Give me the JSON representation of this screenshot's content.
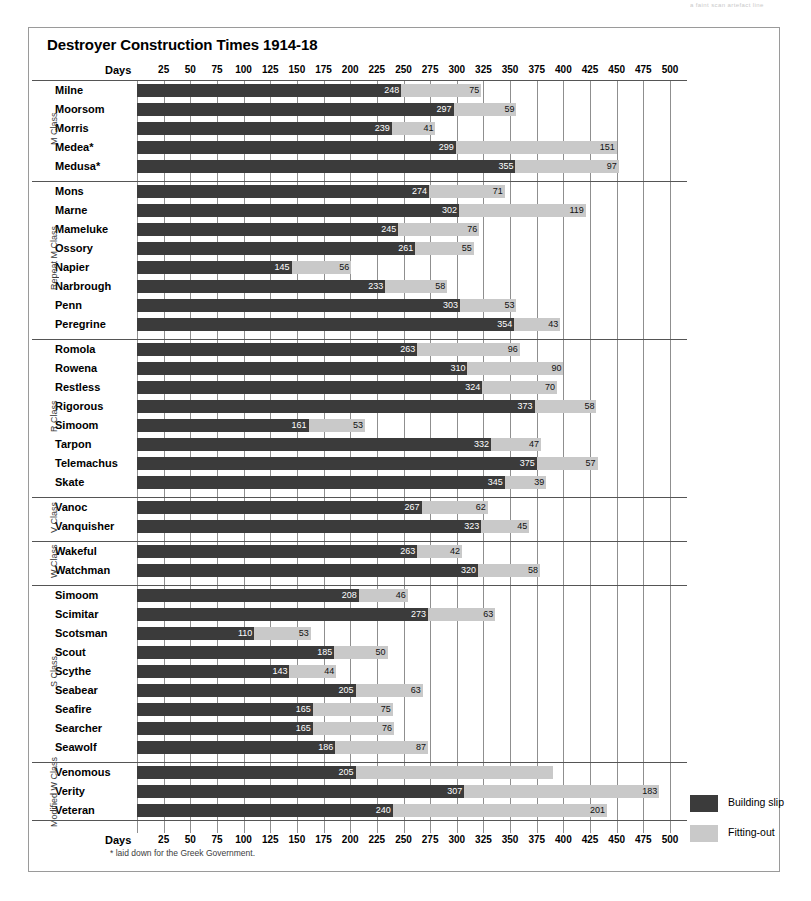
{
  "scan_header": "a faint scan artefact line",
  "title": "Destroyer Construction Times 1914-18",
  "axis": {
    "days_label": "Days",
    "ticks": [
      25,
      50,
      75,
      100,
      125,
      150,
      175,
      200,
      225,
      250,
      275,
      300,
      325,
      350,
      375,
      400,
      425,
      450,
      475,
      500
    ]
  },
  "footnote": "* laid down for the Greek Government.",
  "legend": {
    "position": "right",
    "items": [
      {
        "label": "Building slip",
        "color": "#3b3b3b",
        "key": "slip"
      },
      {
        "label": "Fitting-out",
        "color": "#c9c9c9",
        "key": "fit"
      }
    ]
  },
  "colors": {
    "building_slip": "#3b3b3b",
    "fitting_out": "#c9c9c9",
    "grid": "#8f8f8f",
    "frame": "#9a9a9a"
  },
  "chart_data": {
    "type": "bar",
    "orientation": "horizontal",
    "stacked": true,
    "title": "Destroyer Construction Times 1914-18",
    "xlabel": "Days",
    "ylabel": "",
    "xlim": [
      0,
      500
    ],
    "grid": true,
    "legend": [
      "Building slip",
      "Fitting-out"
    ],
    "series": [
      {
        "name": "Building slip",
        "color": "#3b3b3b"
      },
      {
        "name": "Fitting-out",
        "color": "#c9c9c9"
      }
    ],
    "groups": [
      {
        "class": "M Class",
        "rows": [
          {
            "name": "Milne",
            "slip": 248,
            "fit": 75
          },
          {
            "name": "Moorsom",
            "slip": 297,
            "fit": 59
          },
          {
            "name": "Morris",
            "slip": 239,
            "fit": 41
          },
          {
            "name": "Medea*",
            "slip": 299,
            "fit": 151
          },
          {
            "name": "Medusa*",
            "slip": 355,
            "fit": 97
          }
        ]
      },
      {
        "class": "Repeat M Class",
        "rows": [
          {
            "name": "Mons",
            "slip": 274,
            "fit": 71
          },
          {
            "name": "Marne",
            "slip": 302,
            "fit": 119
          },
          {
            "name": "Mameluke",
            "slip": 245,
            "fit": 76
          },
          {
            "name": "Ossory",
            "slip": 261,
            "fit": 55
          },
          {
            "name": "Napier",
            "slip": 145,
            "fit": 56
          },
          {
            "name": "Narbrough",
            "slip": 233,
            "fit": 58
          },
          {
            "name": "Penn",
            "slip": 303,
            "fit": 53
          },
          {
            "name": "Peregrine",
            "slip": 354,
            "fit": 43
          }
        ]
      },
      {
        "class": "R Class",
        "rows": [
          {
            "name": "Romola",
            "slip": 263,
            "fit": 96
          },
          {
            "name": "Rowena",
            "slip": 310,
            "fit": 90
          },
          {
            "name": "Restless",
            "slip": 324,
            "fit": 70
          },
          {
            "name": "Rigorous",
            "slip": 373,
            "fit": 58
          },
          {
            "name": "Simoom",
            "slip": 161,
            "fit": 53
          },
          {
            "name": "Tarpon",
            "slip": 332,
            "fit": 47
          },
          {
            "name": "Telemachus",
            "slip": 375,
            "fit": 57
          },
          {
            "name": "Skate",
            "slip": 345,
            "fit": 39
          }
        ]
      },
      {
        "class": "V Class",
        "rows": [
          {
            "name": "Vanoc",
            "slip": 267,
            "fit": 62
          },
          {
            "name": "Vanquisher",
            "slip": 323,
            "fit": 45
          }
        ]
      },
      {
        "class": "W Class",
        "rows": [
          {
            "name": "Wakeful",
            "slip": 263,
            "fit": 42
          },
          {
            "name": "Watchman",
            "slip": 320,
            "fit": 58
          }
        ]
      },
      {
        "class": "S Class",
        "rows": [
          {
            "name": "Simoom",
            "slip": 208,
            "fit": 46
          },
          {
            "name": "Scimitar",
            "slip": 273,
            "fit": 63
          },
          {
            "name": "Scotsman",
            "slip": 110,
            "fit": 53
          },
          {
            "name": "Scout",
            "slip": 185,
            "fit": 50
          },
          {
            "name": "Scythe",
            "slip": 143,
            "fit": 44
          },
          {
            "name": "Seabear",
            "slip": 205,
            "fit": 63
          },
          {
            "name": "Seafire",
            "slip": 165,
            "fit": 75
          },
          {
            "name": "Searcher",
            "slip": 165,
            "fit": 76
          },
          {
            "name": "Seawolf",
            "slip": 186,
            "fit": 87
          }
        ]
      },
      {
        "class": "Modified W Class",
        "rows": [
          {
            "name": "Venomous",
            "slip": 205,
            "fit": 185,
            "fit_label": ""
          },
          {
            "name": "Verity",
            "slip": 307,
            "fit": 183
          },
          {
            "name": "Veteran",
            "slip": 240,
            "fit": 201
          }
        ]
      }
    ]
  }
}
